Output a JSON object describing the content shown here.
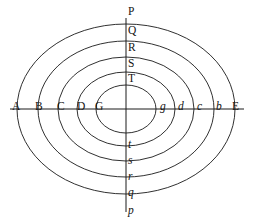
{
  "figure": {
    "background_color": "#ffffff",
    "stroke_color": "#1a1a1a",
    "text_color": "#141414",
    "center": {
      "x": 126,
      "y": 109
    }
  },
  "axes": {
    "horizontal": {
      "name": "horizontal-axis",
      "x1": 10,
      "y1": 109,
      "x2": 244,
      "y2": 109,
      "left_endpoint_label": "A",
      "right_endpoint_label": "E"
    },
    "vertical": {
      "name": "vertical-axis",
      "x1": 126,
      "y1": 18,
      "x2": 126,
      "y2": 212,
      "top_endpoint_label": "P",
      "bottom_endpoint_label": "p"
    }
  },
  "ellipses": [
    {
      "id": "ellipse-1",
      "rx": 109,
      "ry": 85,
      "left_label": "B",
      "right_label": "b",
      "top_label": "Q",
      "bottom_label": "q"
    },
    {
      "id": "ellipse-2",
      "rx": 88,
      "ry": 68,
      "left_label": "C",
      "right_label": "c",
      "top_label": "R",
      "bottom_label": "r"
    },
    {
      "id": "ellipse-3",
      "rx": 68,
      "ry": 52,
      "left_label": "D",
      "right_label": "d",
      "top_label": "S",
      "bottom_label": "s"
    },
    {
      "id": "ellipse-4",
      "rx": 49,
      "ry": 37,
      "left_label": "G",
      "right_label": "g",
      "top_label": "T",
      "bottom_label": "t"
    },
    {
      "id": "ellipse-5",
      "rx": 30,
      "ry": 24,
      "left_label": "",
      "right_label": "",
      "top_label": "",
      "bottom_label": ""
    }
  ],
  "labels": {
    "outer_left": {
      "text": "A",
      "style": "upright",
      "x": 12,
      "y": 101
    },
    "outer_right": {
      "text": "E",
      "style": "upright",
      "x": 232,
      "y": 101
    },
    "outer_top": {
      "text": "P",
      "style": "upright",
      "x": 128,
      "y": 6
    },
    "outer_bottom": {
      "text": "p",
      "style": "italic",
      "x": 128,
      "y": 205
    },
    "left_series": [
      {
        "text": "B",
        "style": "upright",
        "x": 35,
        "y": 101
      },
      {
        "text": "C",
        "style": "upright",
        "x": 57,
        "y": 101
      },
      {
        "text": "D",
        "style": "upright",
        "x": 77,
        "y": 101
      },
      {
        "text": "G",
        "style": "upright",
        "x": 95,
        "y": 101
      }
    ],
    "right_series": [
      {
        "text": "g",
        "style": "italic",
        "x": 160,
        "y": 101
      },
      {
        "text": "d",
        "style": "italic",
        "x": 178,
        "y": 101
      },
      {
        "text": "c",
        "style": "italic",
        "x": 197,
        "y": 101
      },
      {
        "text": "b",
        "style": "italic",
        "x": 216,
        "y": 101
      }
    ],
    "top_series": [
      {
        "text": "Q",
        "style": "upright",
        "x": 128,
        "y": 25
      },
      {
        "text": "R",
        "style": "upright",
        "x": 128,
        "y": 42
      },
      {
        "text": "S",
        "style": "upright",
        "x": 128,
        "y": 58
      },
      {
        "text": "T",
        "style": "upright",
        "x": 128,
        "y": 73
      }
    ],
    "bottom_series": [
      {
        "text": "t",
        "style": "italic",
        "x": 128,
        "y": 139
      },
      {
        "text": "s",
        "style": "italic",
        "x": 128,
        "y": 155
      },
      {
        "text": "r",
        "style": "italic",
        "x": 128,
        "y": 171
      },
      {
        "text": "q",
        "style": "italic",
        "x": 128,
        "y": 187
      }
    ]
  }
}
